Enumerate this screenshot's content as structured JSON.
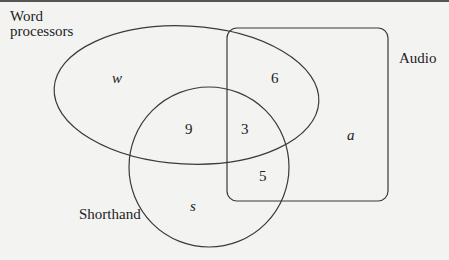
{
  "diagram": {
    "type": "venn",
    "sets": [
      {
        "id": "word_processors",
        "label_line1": "Word",
        "label_line2": "processors",
        "shape": "ellipse"
      },
      {
        "id": "audio",
        "label": "Audio",
        "shape": "rounded-rectangle"
      },
      {
        "id": "shorthand",
        "label": "Shorthand",
        "shape": "circle"
      }
    ],
    "regions": {
      "w_only": "w",
      "w_and_a": "6",
      "w_and_s": "9",
      "w_a_s": "3",
      "a_and_s": "5",
      "a_only": "a",
      "s_only": "s"
    },
    "stroke_color": "#3a3a3a",
    "background_color": "#f3f3f1"
  }
}
